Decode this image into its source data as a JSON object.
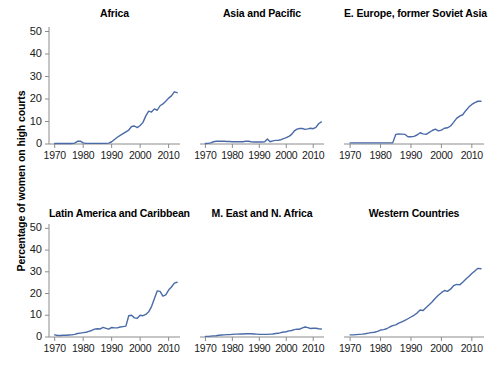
{
  "figure": {
    "ylabel": "Percentage of women on high courts",
    "line_color": "#4a6aa8",
    "axis_color": "#8c8c8c",
    "text_color": "#1a1a1a"
  },
  "chart_data": {
    "type": "line",
    "title": "Percentage of women on high courts",
    "xlabel": "",
    "ylabel": "Percentage of women on high courts",
    "xlim": [
      1968,
      2014
    ],
    "ylim": [
      0,
      52
    ],
    "yticks": [
      0,
      10,
      20,
      30,
      40,
      50
    ],
    "xticks": [
      1970,
      1980,
      1990,
      2000,
      2010
    ],
    "grid": false,
    "legend": "none",
    "layout": "2 rows x 3 columns of small multiples",
    "panels": [
      {
        "title": "Africa",
        "row": 0,
        "col": 0,
        "x": [
          1970,
          1971,
          1972,
          1973,
          1974,
          1975,
          1976,
          1977,
          1978,
          1979,
          1980,
          1981,
          1982,
          1983,
          1984,
          1985,
          1986,
          1987,
          1988,
          1989,
          1990,
          1991,
          1992,
          1993,
          1994,
          1995,
          1996,
          1997,
          1998,
          1999,
          2000,
          2001,
          2002,
          2003,
          2004,
          2005,
          2006,
          2007,
          2008,
          2009,
          2010,
          2011,
          2012,
          2013
        ],
        "y": [
          0.2,
          0.2,
          0.2,
          0.2,
          0.2,
          0.2,
          0.2,
          0.4,
          1.2,
          1.3,
          0.5,
          0.3,
          0.3,
          0.3,
          0.3,
          0.3,
          0.3,
          0.3,
          0.3,
          0.4,
          1.0,
          2.0,
          3.0,
          3.8,
          4.6,
          5.4,
          6.2,
          7.8,
          8.0,
          7.3,
          8.2,
          9.6,
          12.5,
          14.6,
          14.2,
          15.6,
          15.0,
          17.0,
          17.8,
          19.0,
          20.4,
          21.4,
          23.2,
          22.8
        ]
      },
      {
        "title": "Asia and Pacific",
        "row": 0,
        "col": 1,
        "x": [
          1970,
          1971,
          1972,
          1973,
          1974,
          1975,
          1976,
          1977,
          1978,
          1979,
          1980,
          1981,
          1982,
          1983,
          1984,
          1985,
          1986,
          1987,
          1988,
          1989,
          1990,
          1991,
          1992,
          1993,
          1994,
          1995,
          1996,
          1997,
          1998,
          1999,
          2000,
          2001,
          2002,
          2003,
          2004,
          2005,
          2006,
          2007,
          2008,
          2009,
          2010,
          2011,
          2012,
          2013
        ],
        "y": [
          0.2,
          0.3,
          0.5,
          1.0,
          1.2,
          1.2,
          1.2,
          1.2,
          1.1,
          1.1,
          1.0,
          1.0,
          1.0,
          1.0,
          1.0,
          1.3,
          1.2,
          1.0,
          0.9,
          0.9,
          0.9,
          0.9,
          1.0,
          2.2,
          1.0,
          1.4,
          1.6,
          1.6,
          1.9,
          2.4,
          2.8,
          3.4,
          4.3,
          5.8,
          6.6,
          6.9,
          6.9,
          6.5,
          6.7,
          7.0,
          6.8,
          7.4,
          9.0,
          9.8
        ]
      },
      {
        "title": "E. Europe, former Soviet Asia",
        "row": 0,
        "col": 2,
        "x": [
          1970,
          1971,
          1972,
          1973,
          1974,
          1975,
          1976,
          1977,
          1978,
          1979,
          1980,
          1981,
          1982,
          1983,
          1984,
          1985,
          1986,
          1987,
          1988,
          1989,
          1990,
          1991,
          1992,
          1993,
          1994,
          1995,
          1996,
          1997,
          1998,
          1999,
          2000,
          2001,
          2002,
          2003,
          2004,
          2005,
          2006,
          2007,
          2008,
          2009,
          2010,
          2011,
          2012,
          2013
        ],
        "y": [
          0.5,
          0.5,
          0.5,
          0.5,
          0.5,
          0.5,
          0.5,
          0.5,
          0.5,
          0.5,
          0.5,
          0.5,
          0.5,
          0.5,
          0.5,
          4.2,
          4.5,
          4.4,
          4.3,
          3.2,
          3.2,
          3.4,
          4.0,
          5.0,
          4.5,
          4.3,
          5.2,
          6.0,
          6.6,
          5.8,
          6.2,
          7.0,
          7.2,
          8.0,
          9.6,
          11.4,
          12.4,
          13.0,
          14.8,
          16.4,
          17.6,
          18.4,
          19.0,
          19.0
        ]
      },
      {
        "title": "Latin America and Caribbean",
        "row": 1,
        "col": 0,
        "x": [
          1970,
          1971,
          1972,
          1973,
          1974,
          1975,
          1976,
          1977,
          1978,
          1979,
          1980,
          1981,
          1982,
          1983,
          1984,
          1985,
          1986,
          1987,
          1988,
          1989,
          1990,
          1991,
          1992,
          1993,
          1994,
          1995,
          1996,
          1997,
          1998,
          1999,
          2000,
          2001,
          2002,
          2003,
          2004,
          2005,
          2006,
          2007,
          2008,
          2009,
          2010,
          2011,
          2012,
          2013
        ],
        "y": [
          1.0,
          0.7,
          0.7,
          0.8,
          0.8,
          0.9,
          1.0,
          1.2,
          1.6,
          1.8,
          2.0,
          2.2,
          2.6,
          3.0,
          3.6,
          3.8,
          3.7,
          4.4,
          4.0,
          3.6,
          4.4,
          4.2,
          4.2,
          4.6,
          4.8,
          5.0,
          9.8,
          10.0,
          8.8,
          8.6,
          10.0,
          9.8,
          10.4,
          11.6,
          14.0,
          17.6,
          21.2,
          21.0,
          18.8,
          19.4,
          21.6,
          23.0,
          24.8,
          25.2
        ]
      },
      {
        "title": "M. East and N. Africa",
        "row": 1,
        "col": 1,
        "x": [
          1970,
          1971,
          1972,
          1973,
          1974,
          1975,
          1976,
          1977,
          1978,
          1979,
          1980,
          1981,
          1982,
          1983,
          1984,
          1985,
          1986,
          1987,
          1988,
          1989,
          1990,
          1991,
          1992,
          1993,
          1994,
          1995,
          1996,
          1997,
          1998,
          1999,
          2000,
          2001,
          2002,
          2003,
          2004,
          2005,
          2006,
          2007,
          2008,
          2009,
          2010,
          2011,
          2012,
          2013
        ],
        "y": [
          0.3,
          0.3,
          0.4,
          0.5,
          0.6,
          0.8,
          0.9,
          1.0,
          1.1,
          1.1,
          1.2,
          1.3,
          1.3,
          1.4,
          1.4,
          1.5,
          1.5,
          1.5,
          1.4,
          1.3,
          1.2,
          1.2,
          1.2,
          1.2,
          1.3,
          1.4,
          1.6,
          1.7,
          2.0,
          2.3,
          2.4,
          2.8,
          3.0,
          3.4,
          3.6,
          3.6,
          4.2,
          4.6,
          4.3,
          3.9,
          4.0,
          4.0,
          3.8,
          3.7
        ]
      },
      {
        "title": "Western Countries",
        "row": 1,
        "col": 2,
        "x": [
          1970,
          1971,
          1972,
          1973,
          1974,
          1975,
          1976,
          1977,
          1978,
          1979,
          1980,
          1981,
          1982,
          1983,
          1984,
          1985,
          1986,
          1987,
          1988,
          1989,
          1990,
          1991,
          1992,
          1993,
          1994,
          1995,
          1996,
          1997,
          1998,
          1999,
          2000,
          2001,
          2002,
          2003,
          2004,
          2005,
          2006,
          2007,
          2008,
          2009,
          2010,
          2011,
          2012,
          2013
        ],
        "y": [
          1.0,
          1.0,
          1.1,
          1.2,
          1.3,
          1.5,
          1.8,
          2.0,
          2.2,
          2.6,
          3.2,
          3.4,
          3.8,
          4.6,
          5.2,
          5.6,
          6.4,
          7.0,
          7.6,
          8.4,
          9.2,
          10.0,
          11.0,
          12.4,
          12.2,
          13.6,
          14.8,
          16.2,
          17.8,
          19.2,
          20.4,
          21.4,
          21.0,
          22.0,
          23.6,
          24.2,
          24.0,
          25.2,
          26.6,
          27.8,
          29.2,
          30.4,
          31.6,
          31.4
        ]
      }
    ]
  },
  "axes": {
    "yticks": [
      "50",
      "40",
      "30",
      "20",
      "10",
      "0"
    ],
    "xticks": [
      "1970",
      "1980",
      "1990",
      "2000",
      "2010"
    ]
  }
}
